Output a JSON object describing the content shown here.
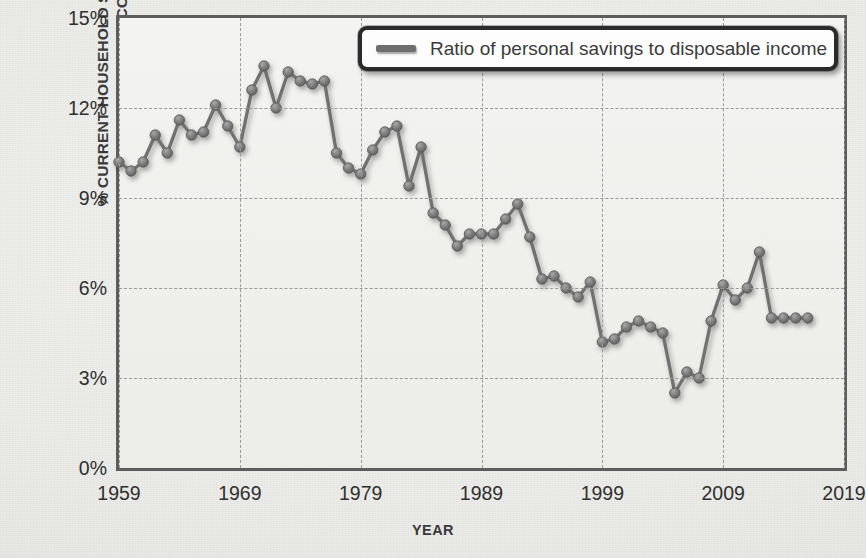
{
  "chart_data": {
    "type": "line",
    "title": "",
    "xlabel": "YEAR",
    "ylabel": "% CURRENT HOUSEHOLD SAVINGS TO DISPOSABLE INCOME",
    "ylabel_line1": "% CURRENT HOUSEHOLD SAVINGS",
    "ylabel_line2": "TO DISPOSABLE INCOME",
    "xlim": [
      1959,
      2019
    ],
    "ylim": [
      0,
      15
    ],
    "grid": true,
    "legend_position": "top-right",
    "y_ticks": [
      0,
      3,
      6,
      9,
      12,
      15
    ],
    "y_tick_labels": [
      "0%",
      "3%",
      "6%",
      "9%",
      "12%",
      "15%"
    ],
    "x_ticks": [
      1959,
      1969,
      1979,
      1989,
      1999,
      2009,
      2019
    ],
    "x_tick_labels": [
      "1959",
      "1969",
      "1979",
      "1989",
      "1999",
      "2009",
      "2019"
    ],
    "series": [
      {
        "name": "Ratio of personal savings to disposable income",
        "color": "#717171",
        "marker": "circle",
        "x": [
          1959,
          1960,
          1961,
          1962,
          1963,
          1964,
          1965,
          1966,
          1967,
          1968,
          1969,
          1970,
          1971,
          1972,
          1973,
          1974,
          1975,
          1976,
          1977,
          1978,
          1979,
          1980,
          1981,
          1982,
          1983,
          1984,
          1985,
          1986,
          1987,
          1988,
          1989,
          1990,
          1991,
          1992,
          1993,
          1994,
          1995,
          1996,
          1997,
          1998,
          1999,
          2000,
          2001,
          2002,
          2003,
          2004,
          2005,
          2006,
          2007,
          2008,
          2009,
          2010,
          2011,
          2012,
          2013,
          2014,
          2015,
          2016
        ],
        "values": [
          10.2,
          9.9,
          10.2,
          11.1,
          10.5,
          11.6,
          11.1,
          11.2,
          12.1,
          11.4,
          10.7,
          12.6,
          13.4,
          12.0,
          13.2,
          12.9,
          12.8,
          12.9,
          10.5,
          10.0,
          9.8,
          10.6,
          11.2,
          11.4,
          9.4,
          10.7,
          8.5,
          8.1,
          7.4,
          7.8,
          7.8,
          7.8,
          8.3,
          8.8,
          7.7,
          6.3,
          6.4,
          6.0,
          5.7,
          6.2,
          4.2,
          4.3,
          4.7,
          4.9,
          4.7,
          4.5,
          2.5,
          3.2,
          3.0,
          4.9,
          6.1,
          5.6,
          6.0,
          7.2,
          5.0,
          5.0,
          5.0,
          5.0
        ]
      }
    ]
  },
  "legend": {
    "label": "Ratio of personal savings to disposable income",
    "swatch": "line-swatch-icon"
  }
}
